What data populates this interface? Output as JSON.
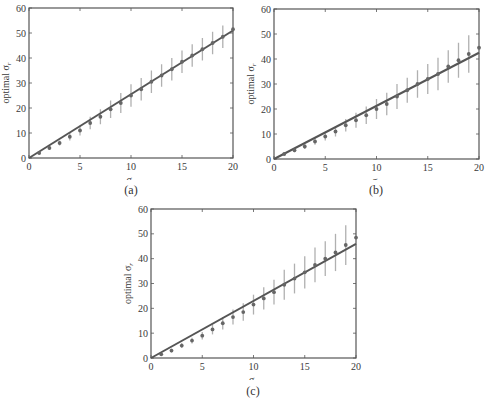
{
  "figure": {
    "captions": [
      "(a)",
      "(b)",
      "(c)"
    ]
  },
  "chart_data": [
    {
      "type": "scatter",
      "panel": "(a)",
      "title": "",
      "xlabel": "σ_n",
      "ylabel": "optimal σ_r",
      "xlim": [
        0,
        20
      ],
      "ylim": [
        0,
        60
      ],
      "xticks": [
        0,
        5,
        10,
        15,
        20
      ],
      "yticks": [
        0,
        10,
        20,
        30,
        40,
        50,
        60
      ],
      "grid": false,
      "legend": null,
      "series": [
        {
          "name": "fit line",
          "kind": "line",
          "x": [
            0,
            20
          ],
          "y": [
            0,
            51
          ]
        },
        {
          "name": "optimal σ_r (mean ± error)",
          "kind": "errorbar",
          "x": [
            1,
            2,
            3,
            4,
            5,
            6,
            7,
            8,
            9,
            10,
            11,
            12,
            13,
            14,
            15,
            16,
            17,
            18,
            19,
            20
          ],
          "y": [
            2,
            4,
            6,
            8.5,
            11,
            14,
            16.5,
            19.5,
            22,
            25,
            27.5,
            30.5,
            33,
            35.5,
            38.5,
            41,
            43.5,
            46,
            48.5,
            51.5
          ],
          "err": [
            0.5,
            0.8,
            1,
            1.5,
            2,
            2.5,
            3,
            3.5,
            4,
            4.5,
            4.5,
            4.5,
            4.5,
            4.5,
            4.5,
            4.5,
            4.5,
            4.5,
            4.5,
            0
          ]
        }
      ]
    },
    {
      "type": "scatter",
      "panel": "(b)",
      "title": "",
      "xlabel": "σ_n",
      "ylabel": "optimal σ_r",
      "xlim": [
        0,
        20
      ],
      "ylim": [
        0,
        60
      ],
      "xticks": [
        0,
        5,
        10,
        15,
        20
      ],
      "yticks": [
        0,
        10,
        20,
        30,
        40,
        50,
        60
      ],
      "grid": false,
      "legend": null,
      "series": [
        {
          "name": "fit line",
          "kind": "line",
          "x": [
            0,
            20
          ],
          "y": [
            0,
            42.5
          ]
        },
        {
          "name": "optimal σ_r (mean ± error)",
          "kind": "errorbar",
          "x": [
            1,
            2,
            3,
            4,
            5,
            6,
            7,
            8,
            9,
            10,
            11,
            12,
            13,
            14,
            15,
            16,
            17,
            18,
            19,
            20
          ],
          "y": [
            2,
            3.5,
            5,
            7,
            9,
            11,
            13.5,
            15.5,
            17.5,
            20,
            22,
            25,
            27.5,
            30,
            32,
            34,
            37,
            39.5,
            42,
            44.5
          ],
          "err": [
            0.5,
            0.8,
            1,
            1.3,
            1.6,
            2,
            2.5,
            3,
            3.5,
            4,
            4.5,
            5,
            5,
            5.5,
            6,
            6.5,
            6.5,
            7,
            7.5,
            0
          ]
        }
      ]
    },
    {
      "type": "scatter",
      "panel": "(c)",
      "title": "",
      "xlabel": "σ_n",
      "ylabel": "optimal σ_r",
      "xlim": [
        0,
        20
      ],
      "ylim": [
        0,
        60
      ],
      "xticks": [
        0,
        5,
        10,
        15,
        20
      ],
      "yticks": [
        0,
        10,
        20,
        30,
        40,
        50,
        60
      ],
      "grid": false,
      "legend": null,
      "series": [
        {
          "name": "fit line",
          "kind": "line",
          "x": [
            0,
            20
          ],
          "y": [
            0,
            46
          ]
        },
        {
          "name": "optimal σ_r (mean ± error)",
          "kind": "errorbar",
          "x": [
            1,
            2,
            3,
            4,
            5,
            6,
            7,
            8,
            9,
            10,
            11,
            12,
            13,
            14,
            15,
            16,
            17,
            18,
            19,
            20
          ],
          "y": [
            1.5,
            3,
            5,
            7,
            9,
            11.5,
            14,
            16.5,
            18.5,
            21.5,
            24,
            26.5,
            29.5,
            32,
            34.5,
            37.5,
            40,
            42.5,
            45.5,
            48.5
          ],
          "err": [
            0.5,
            0.8,
            1,
            1.2,
            1.5,
            2,
            2.5,
            3,
            3.5,
            4,
            4.5,
            5,
            6,
            6,
            6.5,
            7,
            7,
            7.5,
            8,
            0
          ]
        }
      ]
    }
  ],
  "style": {
    "axis_color": "#555555",
    "line_color": "#555555",
    "marker_color": "#666666",
    "errorbar_color": "#b0b0b0"
  }
}
